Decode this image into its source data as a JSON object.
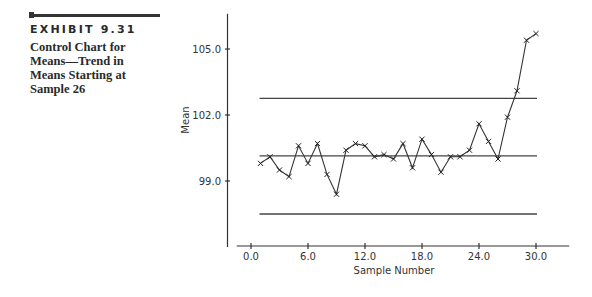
{
  "exhibit": {
    "label": "EXHIBIT 9.31",
    "caption": "Control Chart for Means—Trend in Means Starting at Sample 26"
  },
  "chart_data": {
    "type": "line",
    "title": "Control Chart for Means—Trend in Means Starting at Sample 26",
    "xlabel": "Sample Number",
    "ylabel": "Mean",
    "xlim": [
      -1.5,
      33.5
    ],
    "ylim": [
      96.0,
      106.6
    ],
    "x_ticks": [
      0,
      6,
      12,
      18,
      24,
      30
    ],
    "x_tick_labels": [
      "0.0",
      "6.0",
      "12.0",
      "18.0",
      "24.0",
      "30.0"
    ],
    "y_ticks": [
      99,
      102,
      105
    ],
    "y_tick_labels": [
      "99.0",
      "102.0",
      "105.0"
    ],
    "grid": false,
    "marker": "x",
    "series": [
      {
        "name": "Sample means",
        "x": [
          1,
          2,
          3,
          4,
          5,
          6,
          7,
          8,
          9,
          10,
          11,
          12,
          13,
          14,
          15,
          16,
          17,
          18,
          19,
          20,
          21,
          22,
          23,
          24,
          25,
          26,
          27,
          28,
          29,
          30
        ],
        "values": [
          99.8,
          100.1,
          99.5,
          99.2,
          100.6,
          99.8,
          100.7,
          99.3,
          98.4,
          100.4,
          100.7,
          100.6,
          100.1,
          100.2,
          100.0,
          100.7,
          99.6,
          100.9,
          100.2,
          99.4,
          100.1,
          100.1,
          100.4,
          101.6,
          100.8,
          100.0,
          101.9,
          103.1,
          105.4,
          105.7
        ]
      }
    ],
    "control_limits": {
      "ucl": 102.76,
      "center": 100.14,
      "lcl": 97.5,
      "x_start": 1,
      "x_end": 30
    }
  }
}
